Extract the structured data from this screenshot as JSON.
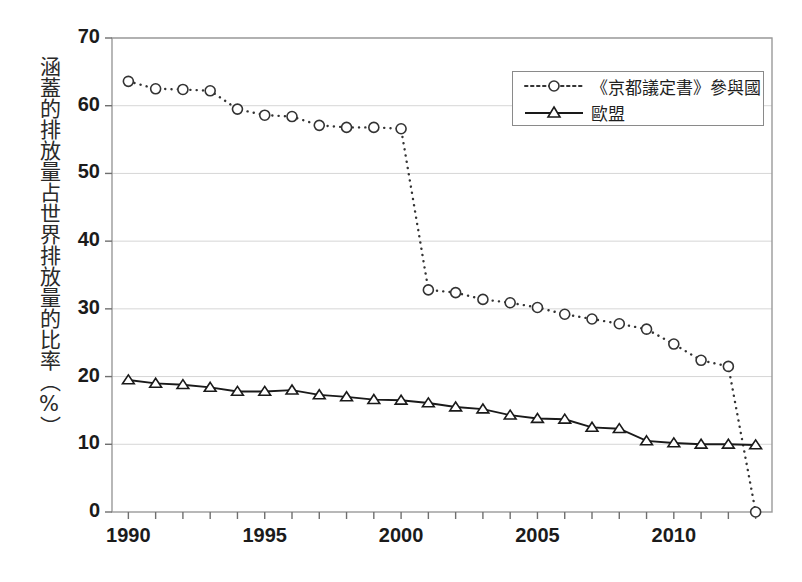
{
  "chart_data": {
    "type": "line",
    "title": "",
    "xlabel": "",
    "ylabel": "涵蓋的排放量占世界排放量的比率（%）",
    "xlim": [
      1989.4,
      2013.6
    ],
    "ylim": [
      0,
      70
    ],
    "grid": true,
    "legend_position": "top-right",
    "x": [
      1990,
      1991,
      1992,
      1993,
      1994,
      1995,
      1996,
      1997,
      1998,
      1999,
      2000,
      2001,
      2002,
      2003,
      2004,
      2005,
      2006,
      2007,
      2008,
      2009,
      2010,
      2011,
      2012,
      2013
    ],
    "y_ticks": [
      0,
      10,
      20,
      30,
      40,
      50,
      60,
      70
    ],
    "y_tick_labels": [
      "0",
      "10",
      "20",
      "30",
      "40",
      "50",
      "60",
      "70"
    ],
    "x_ticks": [
      1990,
      1995,
      2000,
      2005,
      2010
    ],
    "x_tick_labels": [
      "1990",
      "1995",
      "2000",
      "2005",
      "2010"
    ],
    "series": [
      {
        "name": "《京都議定書》參與國",
        "marker": "circle",
        "line_style": "dotted",
        "color": "#333333",
        "values": [
          63.6,
          62.5,
          62.4,
          62.2,
          59.5,
          58.6,
          58.4,
          57.1,
          56.8,
          56.8,
          56.6,
          32.8,
          32.4,
          31.4,
          30.9,
          30.2,
          29.2,
          28.5,
          27.8,
          27.0,
          24.8,
          22.4,
          21.5,
          0.0
        ]
      },
      {
        "name": "歐盟",
        "marker": "triangle",
        "line_style": "solid",
        "color": "#1a1a1a",
        "values": [
          19.5,
          19.0,
          18.8,
          18.4,
          17.8,
          17.8,
          18.0,
          17.3,
          17.0,
          16.6,
          16.5,
          16.1,
          15.5,
          15.2,
          14.3,
          13.8,
          13.7,
          12.5,
          12.3,
          10.5,
          10.2,
          10.0,
          10.0,
          9.9
        ]
      }
    ]
  },
  "axes": {
    "y_title": "涵蓋的排放量占世界排放量的比率（%）"
  },
  "legend": {
    "items": [
      {
        "label": "《京都議定書》參與國",
        "marker": "circle-marker",
        "style": "dotted"
      },
      {
        "label": "歐盟",
        "marker": "triangle-marker",
        "style": "solid"
      }
    ]
  }
}
